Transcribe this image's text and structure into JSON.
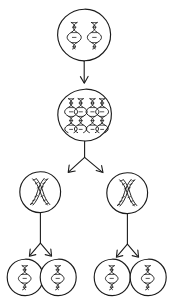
{
  "diagram": {
    "type": "biology-process-flow",
    "background_color": "#ffffff",
    "stroke_color": "#1b1b1b",
    "style": "hand-drawn line art",
    "stage_count": 4,
    "cell_count": 8,
    "arrow_count": 7
  },
  "stages": [
    {
      "id": "stage-1",
      "name": "parent-cell",
      "label": "",
      "cell_count": 1,
      "chromosomes_per_cell": 2,
      "chromosome_form": "single-strand-helix",
      "cells": [
        {
          "id": "cell-parent",
          "cx": 84,
          "cy": 35,
          "r": 26,
          "chromosomes": [
            {
              "x": 74,
              "y": 35,
              "height": 26,
              "form": "helix"
            },
            {
              "x": 94,
              "y": 35,
              "height": 26,
              "form": "helix"
            }
          ]
        }
      ]
    },
    {
      "id": "stage-2",
      "name": "replicated-cell",
      "label": "",
      "cell_count": 1,
      "chromosomes_per_cell": 4,
      "chromosome_form": "duplicated-pair",
      "cells": [
        {
          "id": "cell-replicated",
          "cx": 84,
          "cy": 115,
          "r": 26,
          "chromosomes": [
            {
              "x": 71,
              "y": 115,
              "height": 32,
              "form": "helix"
            },
            {
              "x": 79,
              "y": 115,
              "height": 32,
              "form": "helix"
            },
            {
              "x": 92,
              "y": 115,
              "height": 32,
              "form": "helix"
            },
            {
              "x": 100,
              "y": 115,
              "height": 32,
              "form": "helix"
            }
          ]
        }
      ]
    },
    {
      "id": "stage-3",
      "name": "first-division-daughter-cells",
      "label": "",
      "cell_count": 2,
      "chromosomes_per_cell": 2,
      "chromosome_form": "crossed-x-pair",
      "cells": [
        {
          "id": "cell-daughter-left",
          "cx": 40,
          "cy": 192,
          "r": 20,
          "chromosomes": [
            {
              "x": 40,
              "y": 192,
              "height": 26,
              "form": "crossed-x"
            }
          ]
        },
        {
          "id": "cell-daughter-right",
          "cx": 127,
          "cy": 193,
          "r": 20,
          "chromosomes": [
            {
              "x": 127,
              "y": 193,
              "height": 26,
              "form": "crossed-x"
            }
          ]
        }
      ]
    },
    {
      "id": "stage-4",
      "name": "second-division-gametes",
      "label": "",
      "cell_count": 4,
      "chromosomes_per_cell": 1,
      "chromosome_form": "single-strand-helix",
      "cells": [
        {
          "id": "cell-gamete-1",
          "cx": 25,
          "cy": 277,
          "r": 18,
          "chromosomes": [
            {
              "x": 25,
              "y": 277,
              "height": 24,
              "form": "helix"
            }
          ]
        },
        {
          "id": "cell-gamete-2",
          "cx": 58,
          "cy": 277,
          "r": 18,
          "chromosomes": [
            {
              "x": 58,
              "y": 277,
              "height": 24,
              "form": "helix"
            }
          ]
        },
        {
          "id": "cell-gamete-3",
          "cx": 112,
          "cy": 277,
          "r": 18,
          "chromosomes": [
            {
              "x": 112,
              "y": 277,
              "height": 24,
              "form": "helix"
            }
          ]
        },
        {
          "id": "cell-gamete-4",
          "cx": 148,
          "cy": 277,
          "r": 18,
          "chromosomes": [
            {
              "x": 148,
              "y": 277,
              "height": 24,
              "form": "helix"
            }
          ]
        }
      ]
    }
  ],
  "arrows": [
    {
      "id": "arrow-replication",
      "from": "cell-parent",
      "to": "cell-replicated",
      "direction": "down",
      "shape": "straight"
    },
    {
      "id": "arrow-division-1-left",
      "from": "cell-replicated",
      "to": "cell-daughter-left",
      "direction": "down-left",
      "shape": "branch"
    },
    {
      "id": "arrow-division-1-right",
      "from": "cell-replicated",
      "to": "cell-daughter-right",
      "direction": "down-right",
      "shape": "branch"
    },
    {
      "id": "arrow-division-2-left-a",
      "from": "cell-daughter-left",
      "to": "cell-gamete-1",
      "direction": "down-left",
      "shape": "branch"
    },
    {
      "id": "arrow-division-2-left-b",
      "from": "cell-daughter-left",
      "to": "cell-gamete-2",
      "direction": "down-right",
      "shape": "branch"
    },
    {
      "id": "arrow-division-2-right-a",
      "from": "cell-daughter-right",
      "to": "cell-gamete-3",
      "direction": "down-left",
      "shape": "branch"
    },
    {
      "id": "arrow-division-2-right-b",
      "from": "cell-daughter-right",
      "to": "cell-gamete-4",
      "direction": "down-right",
      "shape": "branch"
    }
  ]
}
